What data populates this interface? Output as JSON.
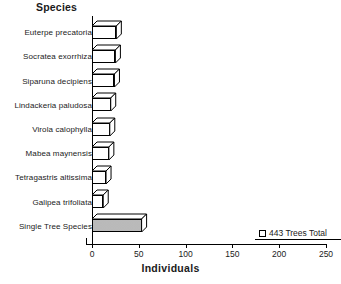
{
  "chart": {
    "y_axis_title": "Species",
    "x_axis_title": "Individuals",
    "legend_label": "443 Trees Total",
    "legend_icon": "pattern-swatch-icon"
  },
  "chart_data": {
    "type": "bar",
    "orientation": "horizontal",
    "title": "",
    "xlabel": "Individuals",
    "ylabel": "Species",
    "xlim": [
      0,
      250
    ],
    "grid": false,
    "legend_position": "bottom-right",
    "legend_entries": [
      "443 Trees Total"
    ],
    "xticks": [
      0,
      50,
      100,
      150,
      200,
      250
    ],
    "xticklabels": [
      "0",
      "50",
      "100",
      "150",
      "200",
      "250"
    ],
    "categories": [
      "Euterpe precatoria",
      "Socratea exorrhiza",
      "Siparuna decipiens",
      "Lindackeria paludosa",
      "Virola calophylla",
      "Mabea maynensis",
      "Tetragastris altissima",
      "Galipea trifoliata",
      "Single Tree Species"
    ],
    "values": [
      26,
      25,
      24,
      20,
      19,
      18,
      15,
      12,
      53
    ],
    "annotations": [
      "443 Trees Total"
    ]
  }
}
